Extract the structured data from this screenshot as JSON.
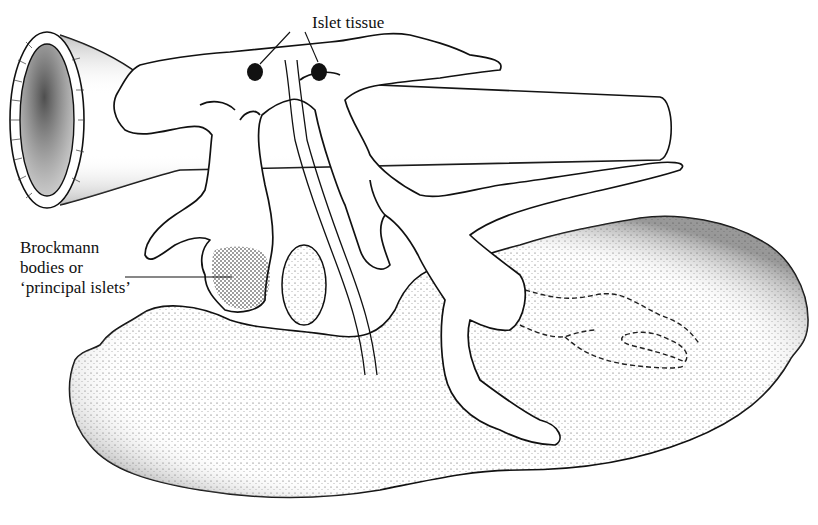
{
  "diagram": {
    "title": "",
    "labels": {
      "islet_tissue": "Islet tissue",
      "brockmann_line1": "Brockmann",
      "brockmann_line2": "bodies or",
      "brockmann_line3": "‘principal islets’"
    },
    "structures": [
      {
        "id": "intestine-tube",
        "description": "Cylindrical gut tube with open end at left"
      },
      {
        "id": "pancreatic-tissue",
        "description": "Branching lobulated pancreatic tissue (white)"
      },
      {
        "id": "islet-tissue",
        "description": "Two small black islet nodules"
      },
      {
        "id": "brockmann-body",
        "description": "Stippled principal islet within a pancreatic lobe"
      },
      {
        "id": "duct",
        "description": "Long double-lined duct running down to lower organ"
      },
      {
        "id": "oval-body",
        "description": "Small oval stippled body (spleen)"
      },
      {
        "id": "liver",
        "description": "Large stippled lobed organ at bottom"
      },
      {
        "id": "dashed-outline",
        "description": "Dashed outline of branches hidden within the liver"
      }
    ],
    "colors": {
      "ink": "#111111",
      "paper": "#ffffff",
      "stipple": "#555555"
    }
  }
}
